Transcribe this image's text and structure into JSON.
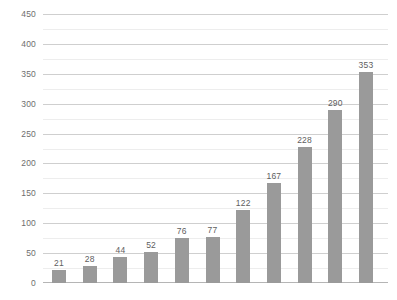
{
  "chart_data": {
    "type": "bar",
    "title": "",
    "subtitle": "",
    "xlabel": "",
    "ylabel": "",
    "categories": [
      "",
      "",
      "",
      "",
      "",
      "",
      "",
      "",
      "",
      "",
      ""
    ],
    "values": [
      21,
      28,
      44,
      52,
      76,
      77,
      122,
      167,
      228,
      290,
      353
    ],
    "data_labels": [
      "21",
      "28",
      "44",
      "52",
      "76",
      "77",
      "122",
      "167",
      "228",
      "290",
      "353"
    ],
    "ylim": [
      0,
      450
    ],
    "ytick_values": [
      0,
      50,
      100,
      150,
      200,
      250,
      300,
      350,
      400,
      450
    ],
    "ytick_labels": [
      "0",
      "50",
      "100",
      "150",
      "200",
      "250",
      "300",
      "350",
      "400",
      "450"
    ],
    "yminor_tick_values": [
      25,
      75,
      125,
      175,
      225,
      275,
      325,
      375,
      425
    ],
    "xtick_labels": [],
    "grid": true,
    "grid_axis": "y",
    "legend": false,
    "legend_position": "none",
    "annotations": [],
    "colors": {
      "bar_fill": "#9a9a9a",
      "major_gridline": "#cfcfcf",
      "minor_gridline": "#ededed",
      "baseline": "#b5b5b5",
      "axis_tick_text": "#6e6e6e",
      "data_label_text": "#5e5e5e",
      "background": "#ffffff"
    }
  }
}
